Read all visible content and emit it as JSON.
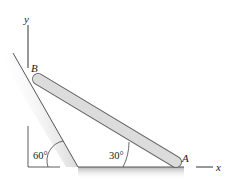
{
  "figure": {
    "type": "statics-diagram",
    "labels": {
      "point_a": "A",
      "point_b": "B",
      "x_axis": "x",
      "y_axis": "y"
    },
    "angles": {
      "wall_angle": "60°",
      "rod_angle": "30°"
    },
    "colors": {
      "rod_fill": "#dcdcdc",
      "rod_stroke": "#6b6b6b",
      "surface_shade": "#bdbdbd",
      "line": "#333333"
    }
  }
}
